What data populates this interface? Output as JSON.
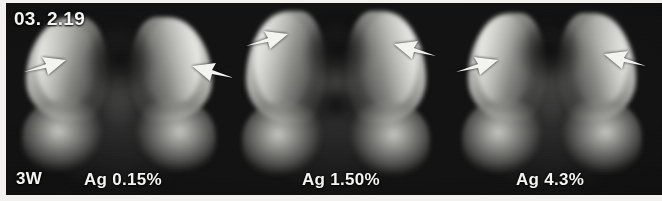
{
  "figure": {
    "modality": "radiograph",
    "date_stamp": "03. 2.19",
    "timepoint_label": "3W",
    "background_color": "#0d0d0d",
    "annotation_color": "#f4f4f2"
  },
  "panels": [
    {
      "id": "panel-ag-015",
      "concentration_label": "Ag 0.15%",
      "arrows": [
        {
          "name": "arrow-left",
          "direction": "up-right"
        },
        {
          "name": "arrow-right",
          "direction": "up-left"
        }
      ]
    },
    {
      "id": "panel-ag-150",
      "concentration_label": "Ag 1.50%",
      "arrows": [
        {
          "name": "arrow-left",
          "direction": "up-right"
        },
        {
          "name": "arrow-right",
          "direction": "up-left"
        }
      ]
    },
    {
      "id": "panel-ag-43",
      "concentration_label": "Ag 4.3%",
      "arrows": [
        {
          "name": "arrow-left",
          "direction": "up-right"
        },
        {
          "name": "arrow-right",
          "direction": "up-left"
        }
      ]
    }
  ]
}
